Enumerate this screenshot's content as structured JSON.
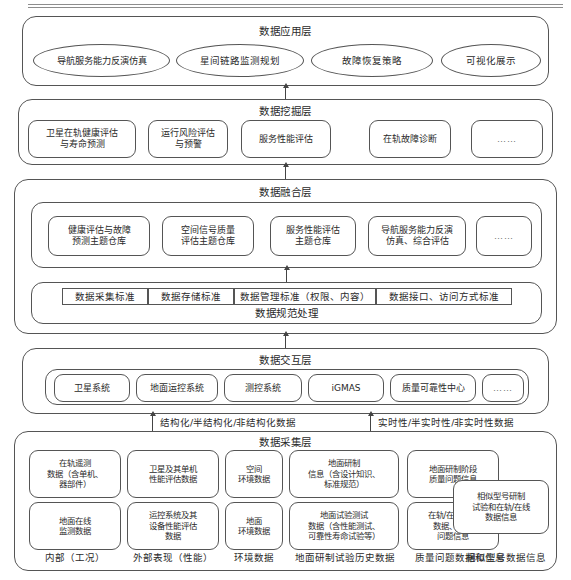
{
  "diagram": {
    "title_rule": "decorative-double-rule",
    "layers": [
      {
        "id": "application",
        "title": "数据应用层",
        "nodes": [
          "导航服务能力反演仿真",
          "星间链路监测规划",
          "故障恢复策略",
          "可视化展示"
        ]
      },
      {
        "id": "mining",
        "title": "数据挖掘层",
        "nodes": [
          "卫星在轨健康评估\n与寿命预测",
          "运行风险评估\n与预警",
          "服务性能评估",
          "在轨故障诊断",
          "……"
        ]
      },
      {
        "id": "fusion",
        "title": "数据融合层",
        "nodes": [
          "健康评估与故障\n预测主题仓库",
          "空间信号质量\n评估主题仓库",
          "服务性能评估\n主题仓库",
          "导航服务能力反演\n仿真、综合评估",
          "……"
        ],
        "standards_title": "数据规范处理",
        "standards": [
          "数据采集标准",
          "数据存储标准",
          "数据管理标准（权限、内容）",
          "数据接口、访问方式标准"
        ]
      },
      {
        "id": "interaction",
        "title": "数据交互层",
        "nodes": [
          "卫星系统",
          "地面运控系统",
          "测控系统",
          "iGMAS",
          "质量可靠性中心",
          "……"
        ]
      },
      {
        "id": "collection",
        "title": "数据采集层",
        "row1": [
          "在轨遥测\n数据（含单机、\n器部件）",
          "卫星及其单机\n性能评估数据",
          "空间\n环境数据",
          "地面研制\n信息（含设计知识、\n标准规范）",
          "地面研制阶段\n质量问题信息"
        ],
        "row2": [
          "地面在线\n监测数据",
          "运控系统及其\n设备性能评估\n数据",
          "地面\n环境数据",
          "地面试验测试\n数据（含性能测试、\n可靠性寿命试验等）",
          "在轨/在线故障\n数据、质量\n问题信息"
        ],
        "wide_node": "相似型号研制\n试验和在轨/在线\n数据信息",
        "column_labels": [
          "内部（工况）",
          "外部表现（性能）",
          "环境数据",
          "地面研制试验历史数据",
          "质量问题数据和信息",
          "相似型号数据信息"
        ]
      }
    ],
    "edge_labels": {
      "structured": "结构化/半结构化/非结构化数据",
      "realtime": "实时性/半实时性/非实时性数据"
    },
    "colors": {
      "stroke": "#555555",
      "text": "#2a2a2a",
      "background": "#ffffff"
    }
  }
}
